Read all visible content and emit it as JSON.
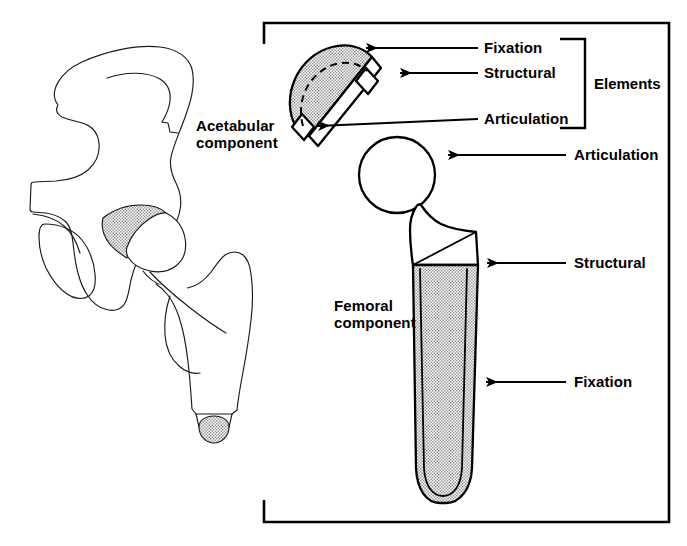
{
  "figure": {
    "background_color": "#ffffff",
    "line_color": "#000000",
    "shade_color": "#d8d8d8"
  },
  "labels": {
    "acetabular_component_line1": "Acetabular",
    "acetabular_component_line2": "component",
    "femoral_component_line1": "Femoral",
    "femoral_component_line2": "component",
    "elements": "Elements",
    "cup_fixation": "Fixation",
    "cup_structural": "Structural",
    "cup_articulation": "Articulation",
    "stem_articulation": "Articulation",
    "stem_structural": "Structural",
    "stem_fixation": "Fixation"
  },
  "callouts": [
    {
      "id": "cup-fixation",
      "label": "Fixation",
      "target": "acetabular-cup-outer-dome"
    },
    {
      "id": "cup-structural",
      "label": "Structural",
      "target": "acetabular-cup-shell-rim"
    },
    {
      "id": "cup-articulation",
      "label": "Articulation",
      "target": "acetabular-cup-bearing-surface"
    },
    {
      "id": "stem-articulation",
      "label": "Articulation",
      "target": "femoral-head-ball"
    },
    {
      "id": "stem-structural",
      "label": "Structural",
      "target": "femoral-stem-neck-body"
    },
    {
      "id": "stem-fixation",
      "label": "Fixation",
      "target": "femoral-stem-coated-shaft"
    }
  ],
  "groups": {
    "elements_bracket_members": [
      "Fixation",
      "Structural",
      "Articulation"
    ]
  },
  "components": {
    "acetabular": {
      "name": "Acetabular component",
      "parts": [
        "outer dome (fixation)",
        "shell (structural)",
        "bearing liner (articulation)"
      ]
    },
    "femoral": {
      "name": "Femoral component",
      "parts": [
        "head (articulation)",
        "neck and proximal body (structural)",
        "coated stem (fixation)"
      ]
    },
    "anatomy": {
      "name": "Hemipelvis and proximal femur outline drawing"
    }
  }
}
